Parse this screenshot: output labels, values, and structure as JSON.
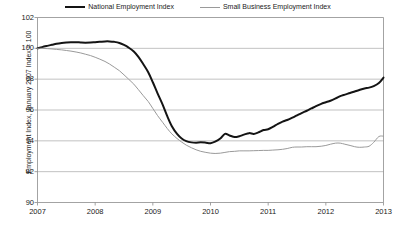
{
  "legend": {
    "position": "top-center",
    "entries": [
      {
        "label": "National Employment Index",
        "color": "#141414",
        "width": 2
      },
      {
        "label": "Small Business Employment Index",
        "color": "#9a9a9a",
        "width": 1
      }
    ]
  },
  "chart_data": {
    "type": "line",
    "title": "",
    "subtitle": "",
    "xlabel": "",
    "ylabel": "Employment Index, January 2007 Index = 100",
    "grid": true,
    "legend_position": "top-center",
    "xlim": [
      2007,
      2013
    ],
    "ylim": [
      90,
      102
    ],
    "yticks": [
      90,
      92,
      94,
      96,
      98,
      100,
      102
    ],
    "xticks": [
      2007,
      2008,
      2009,
      2010,
      2011,
      2012,
      2013
    ],
    "x": [
      2007.0,
      2007.08,
      2007.17,
      2007.25,
      2007.33,
      2007.42,
      2007.5,
      2007.58,
      2007.67,
      2007.75,
      2007.83,
      2007.92,
      2008.0,
      2008.08,
      2008.17,
      2008.25,
      2008.33,
      2008.42,
      2008.5,
      2008.58,
      2008.67,
      2008.75,
      2008.83,
      2008.92,
      2009.0,
      2009.08,
      2009.17,
      2009.25,
      2009.33,
      2009.42,
      2009.5,
      2009.58,
      2009.67,
      2009.75,
      2009.83,
      2009.92,
      2010.0,
      2010.08,
      2010.17,
      2010.25,
      2010.33,
      2010.42,
      2010.5,
      2010.58,
      2010.67,
      2010.75,
      2010.83,
      2010.92,
      2011.0,
      2011.08,
      2011.17,
      2011.25,
      2011.33,
      2011.42,
      2011.5,
      2011.58,
      2011.67,
      2011.75,
      2011.83,
      2011.92,
      2012.0,
      2012.08,
      2012.17,
      2012.25,
      2012.33,
      2012.42,
      2012.5,
      2012.58,
      2012.67,
      2012.75,
      2012.83,
      2012.92,
      2013.0
    ],
    "series": [
      {
        "name": "National Employment Index",
        "color": "#141414",
        "width": 2,
        "values": [
          100.0,
          100.08,
          100.16,
          100.23,
          100.3,
          100.35,
          100.38,
          100.4,
          100.4,
          100.38,
          100.37,
          100.38,
          100.4,
          100.42,
          100.45,
          100.45,
          100.42,
          100.35,
          100.22,
          100.05,
          99.8,
          99.45,
          99.0,
          98.45,
          97.8,
          97.1,
          96.35,
          95.6,
          94.95,
          94.45,
          94.15,
          93.98,
          93.9,
          93.88,
          93.9,
          93.88,
          93.85,
          93.95,
          94.15,
          94.45,
          94.35,
          94.25,
          94.3,
          94.4,
          94.5,
          94.45,
          94.55,
          94.7,
          94.75,
          94.9,
          95.1,
          95.25,
          95.35,
          95.5,
          95.65,
          95.8,
          95.95,
          96.1,
          96.25,
          96.4,
          96.5,
          96.6,
          96.75,
          96.9,
          97.0,
          97.1,
          97.2,
          97.3,
          97.4,
          97.45,
          97.55,
          97.75,
          98.1
        ]
      },
      {
        "name": "Small Business Employment Index",
        "color": "#9a9a9a",
        "width": 1,
        "values": [
          100.0,
          100.0,
          99.98,
          99.96,
          99.93,
          99.9,
          99.86,
          99.82,
          99.76,
          99.7,
          99.62,
          99.53,
          99.42,
          99.3,
          99.15,
          98.98,
          98.78,
          98.55,
          98.28,
          98.0,
          97.68,
          97.32,
          96.95,
          96.55,
          96.1,
          95.65,
          95.2,
          94.8,
          94.45,
          94.15,
          93.92,
          93.72,
          93.55,
          93.42,
          93.32,
          93.25,
          93.2,
          93.18,
          93.2,
          93.25,
          93.3,
          93.32,
          93.35,
          93.35,
          93.35,
          93.36,
          93.37,
          93.38,
          93.38,
          93.4,
          93.42,
          93.45,
          93.5,
          93.58,
          93.6,
          93.6,
          93.62,
          93.62,
          93.62,
          93.65,
          93.7,
          93.78,
          93.85,
          93.85,
          93.78,
          93.7,
          93.62,
          93.58,
          93.6,
          93.65,
          93.9,
          94.28,
          94.3
        ]
      }
    ]
  }
}
